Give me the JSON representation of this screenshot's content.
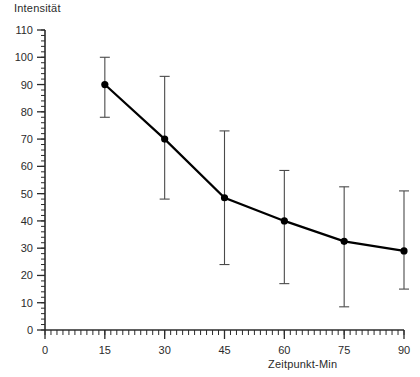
{
  "chart_data": {
    "type": "line",
    "title": "",
    "xlabel": "Zeitpunkt-Min",
    "ylabel": "Intensität",
    "xlim": [
      0,
      90
    ],
    "ylim": [
      0,
      110
    ],
    "grid": false,
    "legend": false,
    "x_ticks": [
      0,
      15,
      30,
      45,
      60,
      75,
      90
    ],
    "y_ticks": [
      0,
      10,
      20,
      30,
      40,
      50,
      60,
      70,
      80,
      90,
      100,
      110
    ],
    "x_minor_tick_interval": 1.5,
    "y_minor_tick_interval": 2,
    "x": [
      15,
      30,
      45,
      60,
      75,
      90
    ],
    "values": [
      90,
      70,
      48.5,
      40,
      32.5,
      29
    ],
    "error_upper": [
      100,
      93,
      73,
      58.5,
      52.5,
      51
    ],
    "error_lower": [
      78,
      48,
      24,
      17,
      8.5,
      15
    ],
    "marker": "filled-circle",
    "marker_color": "#000000",
    "line_color": "#000000",
    "errorbar_color": "#4a4a4a",
    "axis_color": "#2b2b2b"
  },
  "labels": {
    "y_axis_title": "Intensität",
    "x_axis_title": "Zeitpunkt-Min"
  }
}
